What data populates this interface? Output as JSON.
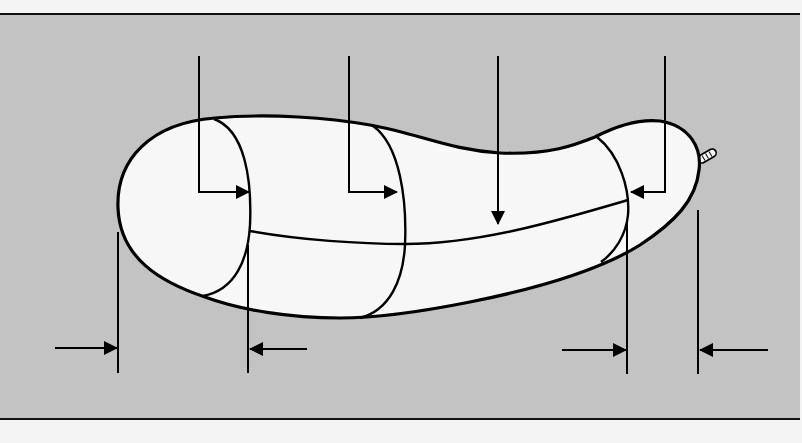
{
  "diagram": {
    "type": "technical-illustration",
    "colors": {
      "page_background": "#f4f4f4",
      "panel_background": "#c3c3c3",
      "body_fill": "#f7f7f7",
      "line": "#000000"
    },
    "panel": {
      "top_rule_y": 14,
      "bottom_rule_y": 419
    },
    "callouts": [
      {
        "id": "callout-1",
        "kind": "elbow-arrow",
        "direction": "right",
        "target": "first-segment-boundary"
      },
      {
        "id": "callout-2",
        "kind": "elbow-arrow",
        "direction": "right",
        "target": "second-segment-boundary"
      },
      {
        "id": "callout-3",
        "kind": "down-arrow",
        "direction": "down",
        "target": "longitudinal-seam"
      },
      {
        "id": "callout-4",
        "kind": "elbow-arrow",
        "direction": "left",
        "target": "third-segment-boundary"
      }
    ],
    "dimensions": [
      {
        "id": "dim-left",
        "kind": "inward-arrows",
        "span": "left end cap"
      },
      {
        "id": "dim-right",
        "kind": "inward-arrows",
        "span": "right end cap"
      }
    ],
    "labels": []
  }
}
